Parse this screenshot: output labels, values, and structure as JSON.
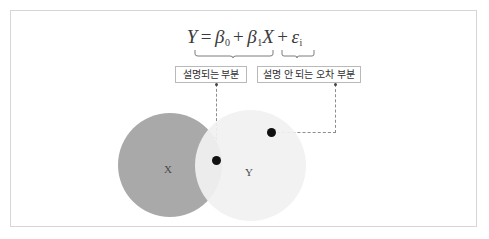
{
  "figure": {
    "type": "venn-regression-decomposition",
    "formula": {
      "response": "Y",
      "equals": "=",
      "intercept_symbol": "β",
      "intercept_sub": "0",
      "plus_1": "+",
      "slope_symbol": "β",
      "slope_sub": "1",
      "predictor": "X",
      "plus_2": "+",
      "error_symbol": "ε",
      "error_sub": "i",
      "plain_text": "Y = β₀ + β₁X + εᵢ"
    },
    "labels": {
      "explained": "설명되는 부분",
      "unexplained": "설명 안 되는 오차 부분"
    },
    "venn": {
      "left_circle_label": "X",
      "right_circle_label": "Y",
      "left_circle_color": "#a9a9a9",
      "right_circle_color": "#f1f1f1"
    },
    "markers": {
      "explained_point": "●",
      "error_point": "●"
    },
    "colors": {
      "frame": "#d6d6d6",
      "box_border": "#b9b9b9",
      "connector": "#8d8d8d",
      "dot": "#111111",
      "text": "#303030"
    }
  }
}
